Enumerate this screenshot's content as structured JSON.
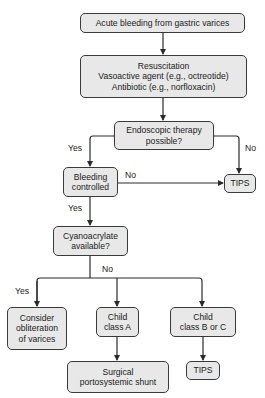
{
  "nodes": {
    "start": {
      "lines": [
        "Acute bleeding from gastric varices"
      ]
    },
    "resuscitation": {
      "lines": [
        "Resuscitation",
        "Vasoactive agent (e.g., octreotide)",
        "Antibiotic (e.g., norfloxacin)"
      ]
    },
    "endoscopic": {
      "lines": [
        "Endoscopic therapy",
        "possible?"
      ]
    },
    "bleeding_controlled": {
      "lines": [
        "Bleeding",
        "controlled"
      ]
    },
    "tips_top": {
      "lines": [
        "TIPS"
      ]
    },
    "cyanoacrylate": {
      "lines": [
        "Cyanoacrylate",
        "available?"
      ]
    },
    "obliteration": {
      "lines": [
        "Consider",
        "obliteration",
        "of varices"
      ]
    },
    "child_a": {
      "lines": [
        "Child",
        "class A"
      ]
    },
    "child_bc": {
      "lines": [
        "Child",
        "class B or C"
      ]
    },
    "shunt": {
      "lines": [
        "Surgical",
        "portosystemic shunt"
      ]
    },
    "tips_bottom": {
      "lines": [
        "TIPS"
      ]
    }
  },
  "edge_labels": {
    "endoscopic_yes": "Yes",
    "endoscopic_no": "No",
    "bleeding_no": "No",
    "bleeding_yes": "Yes",
    "cyano_no": "No",
    "cyano_yes": "Yes"
  },
  "colors": {
    "box_fill": "#e8e8e8",
    "box_border": "#3a3a3a",
    "line": "#2a2a2a"
  }
}
